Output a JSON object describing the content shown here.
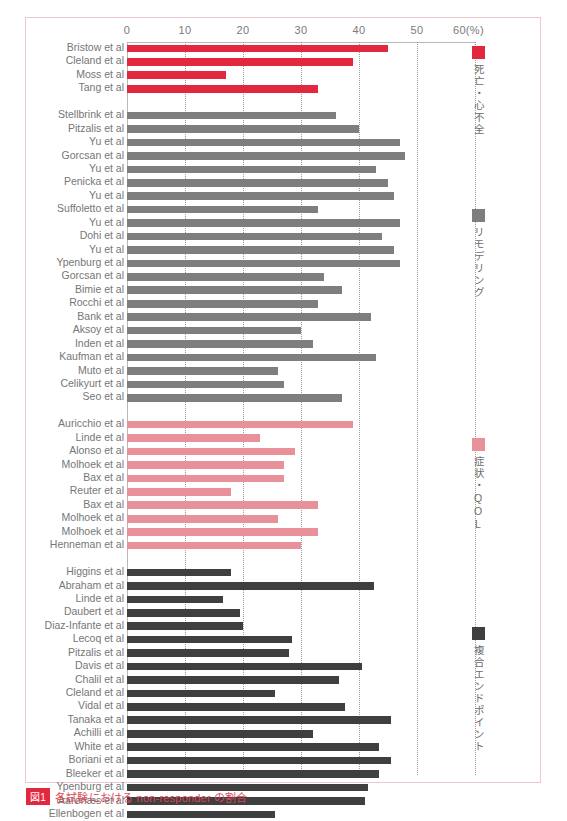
{
  "axis": {
    "ticks": [
      {
        "label": "0",
        "value": 0
      },
      {
        "label": "10",
        "value": 10
      },
      {
        "label": "20",
        "value": 20
      },
      {
        "label": "30",
        "value": 30
      },
      {
        "label": "40",
        "value": 40
      },
      {
        "label": "50",
        "value": 50
      },
      {
        "label": "60(%)",
        "value": 60
      }
    ],
    "unit_label": "(%)"
  },
  "legend": [
    {
      "key": "mortality",
      "label": "死亡・心不全",
      "color": "#e2283f"
    },
    {
      "key": "remodeling",
      "label": "リモデリング",
      "color": "#7e7e7e"
    },
    {
      "key": "symptoms_qol",
      "label": "症状・QOL",
      "color": "#e8919b"
    },
    {
      "key": "composite",
      "label": "複合エンドポイント",
      "color": "#3f3f3f"
    }
  ],
  "caption": {
    "number": "図1",
    "text": "各試験における non-responder の割合"
  },
  "chart_data": {
    "type": "bar",
    "orientation": "horizontal",
    "title": "",
    "xlabel": "(%)",
    "ylabel": "",
    "xlim": [
      0,
      60
    ],
    "grid": true,
    "legend_position": "right",
    "groups": [
      {
        "name": "死亡・心不全",
        "color": "#e2283f",
        "categories": [
          "Bristow et al",
          "Cleland et al",
          "Moss et al",
          "Tang et al"
        ],
        "values": [
          45.0,
          39.0,
          17.0,
          33.0
        ]
      },
      {
        "name": "リモデリング",
        "color": "#7e7e7e",
        "categories": [
          "Stellbrink et al",
          "Pitzalis et al",
          "Yu et al",
          "Gorcsan et al",
          "Yu et al",
          "Penicka et al",
          "Yu et al",
          "Suffoletto et al",
          "Yu et al",
          "Dohi et al",
          "Yu et al",
          "Ypenburg et al",
          "Gorcsan et al",
          "Bimie et al",
          "Rocchi et al",
          "Bank et al",
          "Aksoy et al",
          "Inden et al",
          "Kaufman et al",
          "Muto et al",
          "Celikyurt et al",
          "Seo et al"
        ],
        "values": [
          36.0,
          40.0,
          47.0,
          48.0,
          43.0,
          45.0,
          46.0,
          33.0,
          47.0,
          44.0,
          46.0,
          47.0,
          34.0,
          37.0,
          33.0,
          42.0,
          30.0,
          32.0,
          43.0,
          26.0,
          27.0,
          37.0
        ]
      },
      {
        "name": "症状・QOL",
        "color": "#e8919b",
        "categories": [
          "Auricchio et al",
          "Linde et al",
          "Alonso et al",
          "Molhoek et al",
          "Bax et al",
          "Reuter et al",
          "Bax et al",
          "Molhoek et al",
          "Molhoek et al",
          "Henneman et al"
        ],
        "values": [
          39.0,
          23.0,
          29.0,
          27.0,
          27.0,
          18.0,
          33.0,
          26.0,
          33.0,
          30.0
        ]
      },
      {
        "name": "複合エンドポイント",
        "color": "#3f3f3f",
        "categories": [
          "Higgins et al",
          "Abraham et al",
          "Linde et al",
          "Daubert et al",
          "Diaz-Infante et al",
          "Lecoq et al",
          "Pitzalis et al",
          "Davis et al",
          "Chalil et al",
          "Cleland et al",
          "Vidal et al",
          "Tanaka et al",
          "Achilli et al",
          "White et al",
          "Boriani et al",
          "Bleeker et al",
          "Ypenburg et al",
          "Aarønæs et al",
          "Ellenbogen et al"
        ],
        "values": [
          18.0,
          42.5,
          16.5,
          19.5,
          20.0,
          28.5,
          28.0,
          40.5,
          36.5,
          25.5,
          37.5,
          45.5,
          32.0,
          43.5,
          45.5,
          43.5,
          41.5,
          41.0,
          25.5
        ]
      }
    ]
  }
}
